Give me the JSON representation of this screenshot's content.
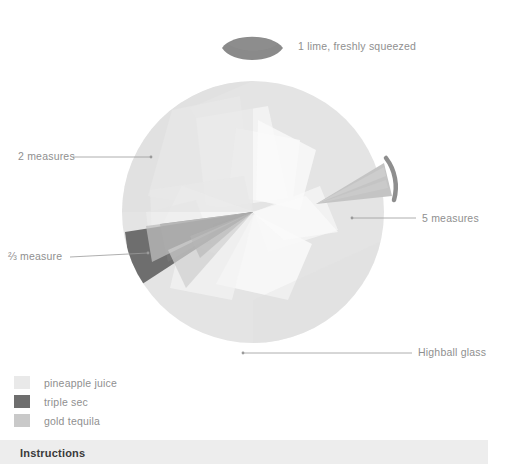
{
  "recipe": {
    "ingredient_callouts": [
      {
        "id": "lime",
        "text": "1 lime, freshly squeezed",
        "icon": "lime-wedge-icon"
      },
      {
        "id": "pineapple",
        "text": "2 measures"
      },
      {
        "id": "triplesec",
        "text": "⅔ measure"
      },
      {
        "id": "tequila",
        "text": "5 measures"
      },
      {
        "id": "glass",
        "text": "Highball glass"
      }
    ],
    "legend": [
      {
        "label": "pineapple juice",
        "color": "#e9e9e9"
      },
      {
        "label": "triple sec",
        "color": "#6e6e6e"
      },
      {
        "label": "gold tequila",
        "color": "#c9c9c9"
      }
    ],
    "instructions": {
      "heading": "Instructions"
    },
    "palette": {
      "background": "#ffffff",
      "glass_fill": "#e4e4e4",
      "pineapple": "#e9e9e9",
      "triple_sec": "#6e6e6e",
      "gold_tequila": "#c9c9c9",
      "lime": "#8a8a8a",
      "rim_arc": "#8e8e8e",
      "leader_line": "#9a9a9a",
      "instructions_bar": "#ededed",
      "text": "#8f8f8f",
      "heading_text": "#3a3a3a"
    }
  }
}
